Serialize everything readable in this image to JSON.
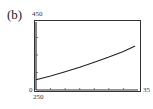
{
  "panel_label": "(b)",
  "window": {
    "ymax_label": "450",
    "ymin_label": "250",
    "xmin_label": "0",
    "xmax_label": "35"
  },
  "chart_data": {
    "type": "line",
    "title": "(b)",
    "xlabel": "",
    "ylabel": "",
    "xlim": [
      0,
      35
    ],
    "ylim": [
      250,
      450
    ],
    "x_tick_step": 5,
    "y_tick_step": 50,
    "grid": false,
    "series": [
      {
        "name": "curve",
        "x": [
          0,
          5,
          10,
          15,
          20,
          25,
          30,
          34
        ],
        "y": [
          279,
          290,
          302,
          315,
          329,
          344,
          360,
          376
        ]
      }
    ]
  }
}
